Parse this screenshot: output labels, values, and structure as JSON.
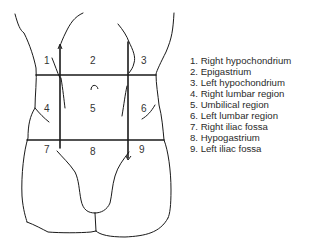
{
  "figure": {
    "region_numbers": [
      {
        "label": "1",
        "x": 44,
        "y": 55
      },
      {
        "label": "2",
        "x": 90,
        "y": 55
      },
      {
        "label": "3",
        "x": 141,
        "y": 55
      },
      {
        "label": "4",
        "x": 44,
        "y": 103
      },
      {
        "label": "5",
        "x": 90,
        "y": 103
      },
      {
        "label": "6",
        "x": 141,
        "y": 103
      },
      {
        "label": "7",
        "x": 44,
        "y": 144
      },
      {
        "label": "8",
        "x": 90,
        "y": 146
      },
      {
        "label": "9",
        "x": 139,
        "y": 144
      }
    ],
    "line_color": "#1a1a1a"
  },
  "legend": {
    "items": [
      "1. Right hypochondrium",
      "2. Epigastrium",
      "3. Left hypochondrium",
      "4. Right lumbar region",
      "5. Umbilical region",
      "6. Left lumbar region",
      "7. Right iliac fossa",
      "8. Hypogastrium",
      "9. Left iliac fossa"
    ]
  }
}
